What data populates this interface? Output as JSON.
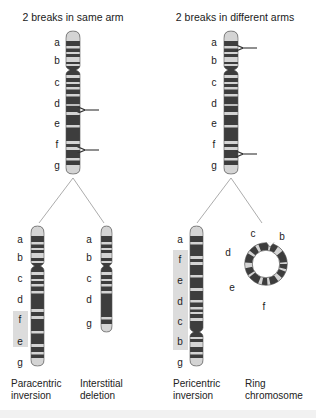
{
  "figure": {
    "titles": {
      "left": "2 breaks in same arm",
      "right": "2 breaks in different arms"
    },
    "colors": {
      "dark_band": "#3d3d3d",
      "light_band": "#d4d4d4",
      "highlight": "#dcdcdc",
      "arrow": "#333333",
      "line": "#888888"
    },
    "top_left_chromosome": {
      "labels": [
        "a",
        "b",
        "c",
        "d",
        "e",
        "f",
        "g"
      ],
      "breakpoints": [
        "between d and e",
        "between f and g"
      ]
    },
    "top_right_chromosome": {
      "labels": [
        "a",
        "b",
        "c",
        "d",
        "e",
        "f",
        "g"
      ],
      "breakpoints": [
        "between a and b",
        "between f and g"
      ]
    },
    "results": [
      {
        "caption_line1": "Paracentric",
        "caption_line2": "inversion",
        "labels": [
          "a",
          "b",
          "c",
          "d",
          "f",
          "e",
          "g"
        ],
        "inverted": [
          "f",
          "e"
        ]
      },
      {
        "caption_line1": "Interstitial",
        "caption_line2": "deletion",
        "labels": [
          "a",
          "b",
          "c",
          "d",
          "g"
        ]
      },
      {
        "caption_line1": "Pericentric",
        "caption_line2": "inversion",
        "labels": [
          "a",
          "f",
          "e",
          "d",
          "c",
          "b",
          "g"
        ],
        "inverted": [
          "f",
          "e",
          "d",
          "c",
          "b"
        ]
      },
      {
        "caption_line1": "Ring",
        "caption_line2": "chromosome",
        "labels": [
          "c",
          "b",
          "d",
          "e",
          "f"
        ]
      }
    ]
  }
}
